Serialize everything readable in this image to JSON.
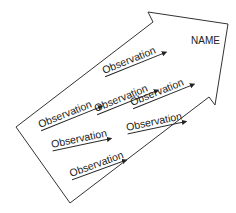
{
  "diagram": {
    "type": "fishbone-arrow",
    "title": "NAME",
    "colors": {
      "stroke": "#333333",
      "text": "#222222",
      "background": "#ffffff"
    },
    "observations": [
      {
        "label": "Observation",
        "x": 100,
        "y": 78
      },
      {
        "label": "Observation",
        "x": 36,
        "y": 130
      },
      {
        "label": "Observation",
        "x": 92,
        "y": 115
      },
      {
        "label": "Observation",
        "x": 129,
        "y": 110
      },
      {
        "label": "Observation",
        "x": 50,
        "y": 150
      },
      {
        "label": "Observation",
        "x": 125,
        "y": 133
      },
      {
        "label": "Observation",
        "x": 69,
        "y": 178
      }
    ]
  }
}
